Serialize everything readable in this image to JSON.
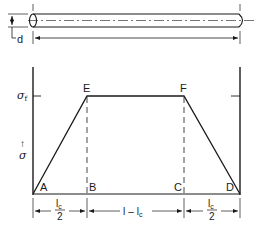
{
  "diagram": {
    "type": "fiber stress distribution",
    "colors": {
      "line": "#1a1a1a",
      "background": "#ffffff"
    },
    "fiber": {
      "diameter_label": "d",
      "length_dimension": "fiber length (no label)"
    },
    "graph": {
      "y_axis_symbol": "σ",
      "y_axis_arrow": "↑",
      "plateau_label": "σ",
      "plateau_subscript": "f",
      "points": {
        "A": "A",
        "B": "B",
        "C": "C",
        "D": "D",
        "E": "E",
        "F": "F"
      }
    },
    "dimensions": {
      "left": {
        "numerator": "l",
        "numerator_sub": "c",
        "denominator": "2"
      },
      "middle": {
        "text_l": "l",
        "dash": "–",
        "text_lc": "l",
        "text_lc_sub": "c"
      },
      "right": {
        "numerator": "l",
        "numerator_sub": "c",
        "denominator": "2"
      }
    }
  }
}
